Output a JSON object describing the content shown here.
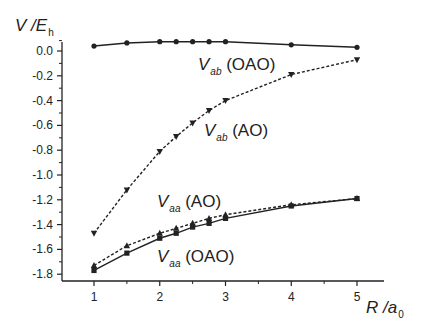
{
  "chart_data": {
    "type": "line",
    "title": "",
    "xlabel": "R / a0",
    "ylabel": "V / Eh",
    "xlabel_parts": {
      "main": "R /a",
      "sub": "0"
    },
    "ylabel_parts": {
      "main": "V /E",
      "sub": "h"
    },
    "xlim": [
      0.5,
      5.4
    ],
    "ylim": [
      -1.88,
      0.1
    ],
    "xticks": [
      1,
      2,
      3,
      4,
      5
    ],
    "xtick_labels": [
      "1",
      "2",
      "3",
      "4",
      "5"
    ],
    "yticks": [
      0.0,
      -0.2,
      -0.4,
      -0.6,
      -0.8,
      -1.0,
      -1.2,
      -1.4,
      -1.6,
      -1.8
    ],
    "ytick_labels": [
      "0.0",
      "-0.2",
      "-0.4",
      "-0.6",
      "-0.8",
      "-1.0",
      "-1.2",
      "-1.4",
      "-1.6",
      "-1.8"
    ],
    "grid": false,
    "legend": "inline labels next to curves",
    "x": [
      1,
      1.5,
      2,
      2.25,
      2.5,
      2.75,
      3,
      4,
      5
    ],
    "series": [
      {
        "name": "V_ab (OAO)",
        "label_main": "V",
        "label_sub": "ab",
        "label_tail": " (OAO)",
        "marker": "circle",
        "line": "solid",
        "values": [
          0.04,
          0.065,
          0.075,
          0.075,
          0.075,
          0.075,
          0.075,
          0.05,
          0.03
        ]
      },
      {
        "name": "V_ab (AO)",
        "label_main": "V",
        "label_sub": "ab",
        "label_tail": " (AO)",
        "marker": "triangle-down",
        "line": "dashed",
        "values": [
          -1.47,
          -1.12,
          -0.81,
          -0.69,
          -0.58,
          -0.48,
          -0.4,
          -0.19,
          -0.07
        ]
      },
      {
        "name": "V_aa (AO)",
        "label_main": "V",
        "label_sub": "aa",
        "label_tail": " (AO)",
        "marker": "triangle-up",
        "line": "dashed",
        "values": [
          -1.73,
          -1.57,
          -1.47,
          -1.43,
          -1.39,
          -1.35,
          -1.32,
          -1.24,
          -1.19
        ]
      },
      {
        "name": "V_aa (OAO)",
        "label_main": "V",
        "label_sub": "aa",
        "label_tail": " (OAO)",
        "marker": "square",
        "line": "solid",
        "values": [
          -1.77,
          -1.63,
          -1.51,
          -1.47,
          -1.42,
          -1.39,
          -1.35,
          -1.25,
          -1.19
        ]
      }
    ]
  },
  "colors": {
    "ink": "#222222",
    "background": "#ffffff"
  }
}
